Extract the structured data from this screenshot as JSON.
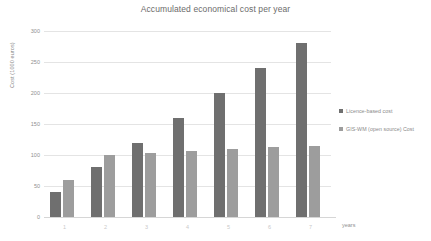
{
  "chart_data": {
    "type": "bar",
    "title": "Accumulated economical cost per year",
    "xlabel": "years",
    "ylabel": "Cost (1000 euros)",
    "categories": [
      "1",
      "2",
      "3",
      "4",
      "5",
      "6",
      "7"
    ],
    "series": [
      {
        "name": "Licence-based cost",
        "color": "#6f6f6f",
        "values": [
          40,
          80,
          120,
          160,
          200,
          240,
          280
        ]
      },
      {
        "name": "GIS-WM (open source) Cost",
        "color": "#9d9d9d",
        "values": [
          60,
          100,
          103,
          107,
          110,
          113,
          115
        ]
      }
    ],
    "ylim": [
      0,
      300
    ],
    "yticks": [
      0,
      50,
      100,
      150,
      200,
      250,
      300
    ],
    "ytick_labels": [
      "0",
      "50",
      "100",
      "150",
      "200",
      "250",
      "300"
    ],
    "grid": true,
    "legend_position": "right"
  }
}
